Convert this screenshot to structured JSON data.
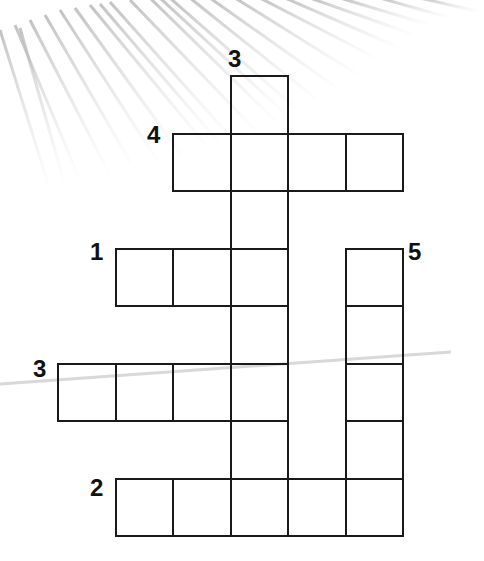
{
  "puzzle": {
    "type": "crossword",
    "cell_size": 57.5,
    "origin": {
      "x": 57,
      "y": 75
    },
    "line_color": "#1a1a1a",
    "clue_numbers": [
      {
        "label": "3",
        "direction": "down",
        "x": 228,
        "y": 47
      },
      {
        "label": "4",
        "direction": "across",
        "x": 147,
        "y": 123
      },
      {
        "label": "1",
        "direction": "across",
        "x": 90,
        "y": 240
      },
      {
        "label": "5",
        "direction": "down",
        "x": 408,
        "y": 240
      },
      {
        "label": "3",
        "direction": "across",
        "x": 33,
        "y": 357
      },
      {
        "label": "2",
        "direction": "across",
        "x": 90,
        "y": 476
      }
    ],
    "words": [
      {
        "number": "3",
        "direction": "down",
        "row": 0,
        "col": 3,
        "length": 8
      },
      {
        "number": "4",
        "direction": "across",
        "row": 1,
        "col": 2,
        "length": 4
      },
      {
        "number": "1",
        "direction": "across",
        "row": 3,
        "col": 1,
        "length": 3
      },
      {
        "number": "5",
        "direction": "down",
        "row": 3,
        "col": 5,
        "length": 5
      },
      {
        "number": "3",
        "direction": "across",
        "row": 5,
        "col": 0,
        "length": 4
      },
      {
        "number": "2",
        "direction": "across",
        "row": 7,
        "col": 1,
        "length": 5
      }
    ]
  }
}
